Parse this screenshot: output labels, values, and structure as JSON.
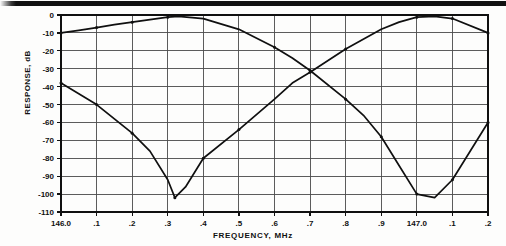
{
  "figure": {
    "name": "filter-response-plot",
    "artifact_band": "scan-artifact-black-band"
  },
  "chart_data": {
    "type": "line",
    "title": "",
    "xlabel": "FREQUENCY, MHz",
    "ylabel": "RESPONSE, dB",
    "xlim": [
      146.0,
      147.2
    ],
    "ylim": [
      -110,
      0
    ],
    "grid": true,
    "legend": "none",
    "x_tick_labels": [
      "146.0",
      ".1",
      ".2",
      ".3",
      ".4",
      ".5",
      ".6",
      ".7",
      ".8",
      ".9",
      "147.0",
      ".1",
      ".2"
    ],
    "x_tick_values": [
      146.0,
      146.1,
      146.2,
      146.3,
      146.4,
      146.5,
      146.6,
      146.7,
      146.8,
      146.9,
      147.0,
      147.1,
      147.2
    ],
    "y_tick_labels": [
      "0",
      "-10",
      "-20",
      "-30",
      "-40",
      "-50",
      "-60",
      "-70",
      "-80",
      "-90",
      "-100",
      "-110"
    ],
    "y_tick_values": [
      0,
      -10,
      -20,
      -30,
      -40,
      -50,
      -60,
      -70,
      -80,
      -90,
      -100,
      -110
    ],
    "series": [
      {
        "name": "upper-passband-response",
        "marker": "dot",
        "x": [
          146.0,
          146.05,
          146.1,
          146.15,
          146.2,
          146.25,
          146.3,
          146.33,
          146.4,
          146.5,
          146.6,
          146.65,
          146.7,
          146.8,
          146.85,
          146.9,
          146.95,
          147.0,
          147.05,
          147.1,
          147.2
        ],
        "y": [
          -10.0,
          -8.6,
          -7.0,
          -5.4,
          -4.0,
          -2.6,
          -1.2,
          -0.8,
          -2.0,
          -8.0,
          -18.0,
          -24.0,
          -31.0,
          -47.0,
          -56.0,
          -68.0,
          -84.0,
          -100.0,
          -102.0,
          -92.0,
          -60.0
        ]
      },
      {
        "name": "lower-passband-response",
        "marker": "dot",
        "x": [
          146.0,
          146.05,
          146.1,
          146.15,
          146.2,
          146.25,
          146.3,
          146.32,
          146.35,
          146.4,
          146.5,
          146.6,
          146.65,
          146.7,
          146.8,
          146.9,
          146.95,
          147.0,
          147.05,
          147.1,
          147.2
        ],
        "y": [
          -38.0,
          -44.0,
          -50.0,
          -58.0,
          -66.0,
          -76.0,
          -92.0,
          -102.0,
          -96.0,
          -80.0,
          -64.0,
          -47.0,
          -38.0,
          -32.0,
          -19.0,
          -8.0,
          -4.0,
          -1.2,
          -0.8,
          -2.0,
          -10.0
        ]
      }
    ],
    "data_point_markers": [
      {
        "series": 0,
        "x": 146.0,
        "y": -10.0
      },
      {
        "series": 0,
        "x": 146.1,
        "y": -7.0
      },
      {
        "series": 0,
        "x": 146.2,
        "y": -4.0
      },
      {
        "series": 0,
        "x": 146.3,
        "y": -1.2
      },
      {
        "series": 0,
        "x": 146.6,
        "y": -18.0
      },
      {
        "series": 0,
        "x": 146.7,
        "y": -31.0
      },
      {
        "series": 0,
        "x": 146.8,
        "y": -47.0
      },
      {
        "series": 0,
        "x": 146.9,
        "y": -68.0
      },
      {
        "series": 0,
        "x": 147.0,
        "y": -100.0
      },
      {
        "series": 0,
        "x": 147.1,
        "y": -92.0
      },
      {
        "series": 0,
        "x": 147.2,
        "y": -60.0
      },
      {
        "series": 1,
        "x": 146.0,
        "y": -38.0
      },
      {
        "series": 1,
        "x": 146.1,
        "y": -50.0
      },
      {
        "series": 1,
        "x": 146.2,
        "y": -66.0
      },
      {
        "series": 1,
        "x": 146.32,
        "y": -102.0
      },
      {
        "series": 1,
        "x": 146.4,
        "y": -80.0
      },
      {
        "series": 1,
        "x": 146.5,
        "y": -64.0
      },
      {
        "series": 1,
        "x": 146.7,
        "y": -32.0
      },
      {
        "series": 1,
        "x": 146.8,
        "y": -19.0
      },
      {
        "series": 1,
        "x": 147.0,
        "y": -1.2
      },
      {
        "series": 1,
        "x": 147.1,
        "y": -2.0
      },
      {
        "series": 1,
        "x": 147.2,
        "y": -10.0
      }
    ],
    "colors": {
      "curve": "#101010",
      "grid": "#4a4a4a",
      "frame": "#101010",
      "text": "#101010",
      "background": "#fdfdfc"
    }
  }
}
